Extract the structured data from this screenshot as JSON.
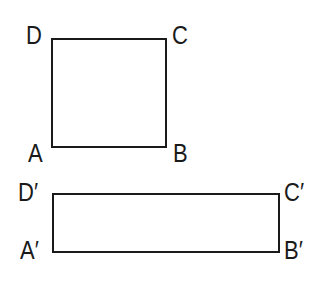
{
  "diagram": {
    "figures": [
      {
        "name": "ABCD",
        "shape": "square",
        "box": {
          "x": 51,
          "y": 38,
          "width": 116,
          "height": 110
        },
        "vertices": {
          "top_left": {
            "label": "D",
            "x": 26,
            "y": 23
          },
          "top_right": {
            "label": "C",
            "x": 172,
            "y": 23
          },
          "bottom_left": {
            "label": "A",
            "x": 28,
            "y": 141
          },
          "bottom_right": {
            "label": "B",
            "x": 173,
            "y": 141
          }
        }
      },
      {
        "name": "A'B'C'D'",
        "shape": "rectangle",
        "box": {
          "x": 52,
          "y": 193,
          "width": 228,
          "height": 60
        },
        "vertices": {
          "top_left": {
            "label": "D′",
            "x": 18,
            "y": 180
          },
          "top_right": {
            "label": "C′",
            "x": 284,
            "y": 180
          },
          "bottom_left": {
            "label": "A′",
            "x": 20,
            "y": 238
          },
          "bottom_right": {
            "label": "B′",
            "x": 284,
            "y": 238
          }
        }
      }
    ],
    "stroke_color": "#1a1a1a",
    "background_color": "#ffffff"
  }
}
